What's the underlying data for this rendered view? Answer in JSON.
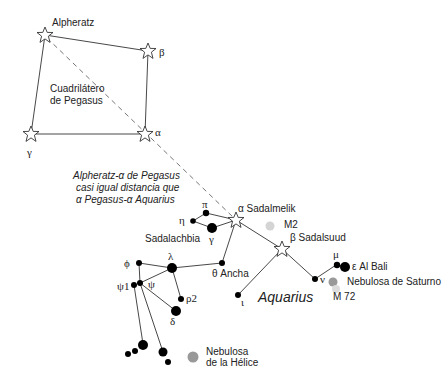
{
  "diagram": {
    "pegasus": {
      "title_line1": "Cuadrilátero",
      "title_line2": "de Pegasus",
      "stars": [
        {
          "id": "alpheratz",
          "label": "Alpheratz",
          "x": 45,
          "y": 35
        },
        {
          "id": "beta-peg",
          "label": "β",
          "x": 148,
          "y": 51
        },
        {
          "id": "gamma-peg",
          "label": "γ",
          "x": 31,
          "y": 134
        },
        {
          "id": "alpha-peg",
          "label": "α",
          "x": 145,
          "y": 134
        }
      ]
    },
    "annotation": {
      "line1": "Alpheratz-α de Pegasus",
      "line2": "casi igual distancia que",
      "line3": "α Pegasus-α Aquarius"
    },
    "aquarius": {
      "name": "Aquarius",
      "stars": [
        {
          "id": "sadalmelik",
          "label": "α Sadalmelik",
          "x": 236,
          "y": 220,
          "type": "open-star"
        },
        {
          "id": "sadalsuud",
          "label": "β Sadalsuud",
          "x": 282,
          "y": 249,
          "type": "open-star"
        },
        {
          "id": "pi",
          "label": "π",
          "x": 206,
          "y": 213
        },
        {
          "id": "eta",
          "label": "η",
          "x": 193,
          "y": 221
        },
        {
          "id": "gamma",
          "label": "γ",
          "x": 212,
          "y": 228
        },
        {
          "id": "sadalachbia",
          "label": "Sadalachbia"
        },
        {
          "id": "theta",
          "label": "θ Ancha",
          "x": 222,
          "y": 263
        },
        {
          "id": "iota",
          "label": "ι",
          "x": 238,
          "y": 295
        },
        {
          "id": "nu",
          "label": "ν",
          "x": 315,
          "y": 279
        },
        {
          "id": "mu",
          "label": "μ",
          "x": 336,
          "y": 265
        },
        {
          "id": "epsilon",
          "label": "ε Al Bali",
          "x": 344,
          "y": 266
        },
        {
          "id": "lambda",
          "label": "λ",
          "x": 172,
          "y": 268
        },
        {
          "id": "phi",
          "label": "ϕ",
          "x": 139,
          "y": 263
        },
        {
          "id": "psi",
          "label": "ψ",
          "x": 140,
          "y": 283
        },
        {
          "id": "psi1",
          "label": "ψ1",
          "x": 134,
          "y": 285
        },
        {
          "id": "rho2",
          "label": "ρ2",
          "x": 181,
          "y": 299
        },
        {
          "id": "delta",
          "label": "δ",
          "x": 176,
          "y": 311
        }
      ]
    },
    "objects": {
      "m2": "M2",
      "saturn_nebula": "Nebulosa de Saturno",
      "m72": "M 72",
      "helix_line1": "Nebulosa",
      "helix_line2": "de la Hélice"
    },
    "colors": {
      "line": "#333333",
      "dashed": "#777777",
      "nebula": "#999999",
      "cluster": "#cccccc"
    }
  }
}
